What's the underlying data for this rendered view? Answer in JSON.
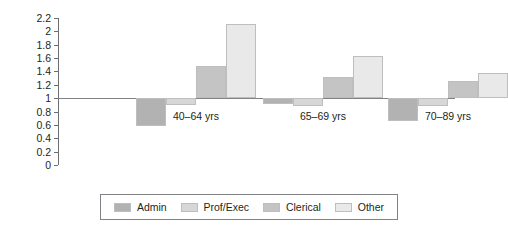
{
  "chart_data": {
    "type": "bar",
    "title": "",
    "subtitle": "",
    "xlabel": "",
    "ylabel": "",
    "categories": [
      "40–64 yrs",
      "65–69 yrs",
      "70–89 yrs"
    ],
    "series": [
      {
        "name": "Admin",
        "values": [
          0.58,
          0.91,
          0.66
        ],
        "color": "#b2b2b2"
      },
      {
        "name": "Prof/Exec",
        "values": [
          0.9,
          0.89,
          0.88
        ],
        "color": "#d7d7d7"
      },
      {
        "name": "Clerical",
        "values": [
          1.48,
          1.32,
          1.25
        ],
        "color": "#c4c4c4"
      },
      {
        "name": "Other",
        "values": [
          2.11,
          1.63,
          1.37
        ],
        "color": "#e9e9e9"
      }
    ],
    "baseline": 1,
    "ylim": [
      0,
      2.2
    ],
    "ytick_step": 0.2,
    "ytick_labels": [
      "0",
      "0.2",
      "0.4",
      "0.6",
      "0.8",
      "1",
      "1.2",
      "1.4",
      "1.6",
      "1.8",
      "2",
      "2.2"
    ],
    "ytick_values": [
      0,
      0.2,
      0.4,
      0.6,
      0.8,
      1,
      1.2,
      1.4,
      1.6,
      1.8,
      2,
      2.2
    ],
    "grid": false,
    "legend_position": "bottom",
    "axis_color": "#6d6e71",
    "baseline_color": "#808285",
    "bar_border_color": "#bcbec0"
  },
  "legend": {
    "items": [
      {
        "label": "Admin"
      },
      {
        "label": "Prof/Exec"
      },
      {
        "label": "Clerical"
      },
      {
        "label": "Other"
      }
    ]
  }
}
